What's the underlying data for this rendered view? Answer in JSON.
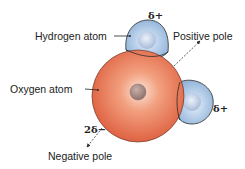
{
  "diagram": {
    "labels": {
      "hydrogen_atom": "Hydrogen atom",
      "oxygen_atom": "Oxygen atom",
      "positive_pole": "Positive pole",
      "negative_pole": "Negative pole",
      "delta_plus_top": "δ+",
      "delta_plus_right": "δ+",
      "two_delta_minus": "2δ−"
    },
    "colors": {
      "oxygen": "#e2684a",
      "oxygen_highlight": "#fbe3d8",
      "hydrogen": "#a9c6e4",
      "hydrogen_highlight": "#e4eef8",
      "nucleus": "#a48a82",
      "outline": "#2a2a2a"
    }
  }
}
